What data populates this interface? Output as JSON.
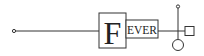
{
  "diagram": {
    "label_initial": "F",
    "label_rest": "EVER",
    "stroke_color": "#333333",
    "background": "#ffffff"
  }
}
